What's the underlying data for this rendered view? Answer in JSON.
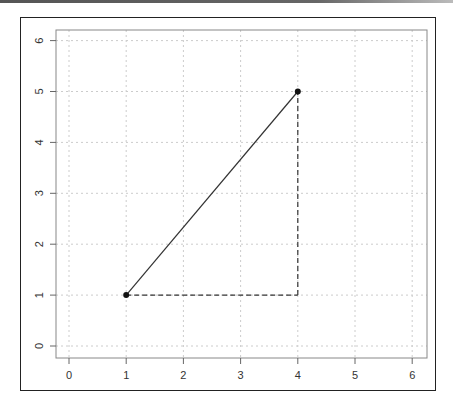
{
  "chart_data": {
    "type": "line",
    "title": "",
    "xlabel": "",
    "ylabel": "",
    "xlim": [
      -0.2,
      6.25
    ],
    "ylim": [
      -0.2,
      6.22
    ],
    "grid": true,
    "x_ticks": [
      "0",
      "1",
      "2",
      "3",
      "4",
      "5",
      "6"
    ],
    "y_ticks": [
      "0",
      "1",
      "2",
      "3",
      "4",
      "5",
      "6"
    ],
    "x_tick_values": [
      0,
      1,
      2,
      3,
      4,
      5,
      6
    ],
    "y_tick_values": [
      0,
      1,
      2,
      3,
      4,
      5,
      6
    ],
    "points": [
      {
        "x": 1,
        "y": 1
      },
      {
        "x": 4,
        "y": 5
      }
    ],
    "series": [
      {
        "name": "hypotenuse",
        "style": "solid",
        "x": [
          1,
          4
        ],
        "y": [
          1,
          5
        ]
      },
      {
        "name": "horizontal-leg",
        "style": "dashed",
        "x": [
          1,
          4
        ],
        "y": [
          1,
          1
        ]
      },
      {
        "name": "vertical-leg",
        "style": "dashed",
        "x": [
          4,
          4
        ],
        "y": [
          1,
          5
        ]
      }
    ],
    "colors": {
      "line": "#333333",
      "point": "#111111",
      "grid": "#cccccc",
      "axis": "#888888"
    }
  }
}
